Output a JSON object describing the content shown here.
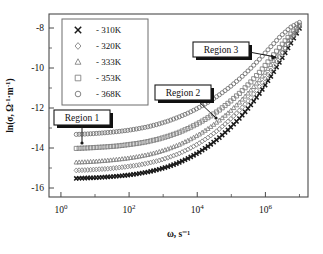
{
  "figure": {
    "kind": "scientific-plot",
    "background": "#ffffff"
  },
  "axes": {
    "x": {
      "label": "ω, s⁻¹",
      "scale": "log",
      "tick_labels": [
        "10⁰",
        "10²",
        "10⁴",
        "10⁶"
      ],
      "tick_exponents": [
        0,
        2,
        4,
        6
      ],
      "range_exponents": [
        -0.35,
        7.25
      ]
    },
    "y": {
      "label": "ln(σ, Ω⁻¹·m⁻¹)",
      "scale": "linear",
      "tick_labels": [
        "-8",
        "-10",
        "-12",
        "-14",
        "-16"
      ],
      "tick_values": [
        -8,
        -10,
        -12,
        -14,
        -16
      ],
      "range": [
        -16.45,
        -7.3
      ]
    }
  },
  "legend": {
    "entries": [
      {
        "marker": "cross-x",
        "dash": "-",
        "label": "310K",
        "color": "#1a1a1a"
      },
      {
        "marker": "diamond",
        "dash": "-",
        "label": "320K",
        "color": "#7d7d7d"
      },
      {
        "marker": "triangle",
        "dash": "-",
        "label": "333K",
        "color": "#7d7d7d"
      },
      {
        "marker": "square",
        "dash": "-",
        "label": "353K",
        "color": "#7d7d7d"
      },
      {
        "marker": "circle",
        "dash": "-",
        "label": "368K",
        "color": "#6f6f6f"
      }
    ]
  },
  "annotations": [
    {
      "id": "region-1",
      "text": "Region 1"
    },
    {
      "id": "region-2",
      "text": "Region 2"
    },
    {
      "id": "region-3",
      "text": "Region 3"
    }
  ],
  "chart_data": {
    "type": "scatter",
    "title": "",
    "xlabel": "ω, s⁻¹",
    "ylabel": "ln(σ, Ω⁻¹·m⁻¹)",
    "xscale": "log",
    "xlim_exponents": [
      -0.35,
      7.25
    ],
    "ylim": [
      -16.45,
      -7.3
    ],
    "grid": false,
    "legend_position": "top-left",
    "x_log10": [
      0.45,
      0.75,
      1.05,
      1.35,
      1.65,
      1.95,
      2.25,
      2.55,
      2.85,
      3.15,
      3.45,
      3.75,
      4.05,
      4.35,
      4.65,
      4.95,
      5.25,
      5.55,
      5.85,
      6.15,
      6.45,
      6.75,
      7.0
    ],
    "series": [
      {
        "name": "310K",
        "marker": "cross-x",
        "color": "#1a1a1a",
        "dc_plateau": -15.5,
        "values": [
          -15.52,
          -15.5,
          -15.48,
          -15.45,
          -15.41,
          -15.36,
          -15.29,
          -15.2,
          -15.08,
          -14.93,
          -14.74,
          -14.5,
          -14.22,
          -13.88,
          -13.48,
          -13.02,
          -12.5,
          -11.9,
          -11.22,
          -10.45,
          -9.62,
          -8.75,
          -8.02
        ]
      },
      {
        "name": "320K",
        "marker": "diamond",
        "color": "#7d7d7d",
        "dc_plateau": -15.1,
        "values": [
          -15.12,
          -15.1,
          -15.07,
          -15.04,
          -14.99,
          -14.93,
          -14.86,
          -14.76,
          -14.64,
          -14.48,
          -14.29,
          -14.05,
          -13.77,
          -13.44,
          -13.05,
          -12.6,
          -12.1,
          -11.53,
          -10.88,
          -10.15,
          -9.36,
          -8.58,
          -7.95
        ]
      },
      {
        "name": "333K",
        "marker": "triangle",
        "color": "#7d7d7d",
        "dc_plateau": -14.7,
        "values": [
          -14.72,
          -14.7,
          -14.67,
          -14.63,
          -14.58,
          -14.52,
          -14.44,
          -14.34,
          -14.21,
          -14.05,
          -13.85,
          -13.61,
          -13.33,
          -13.0,
          -12.62,
          -12.19,
          -11.7,
          -11.16,
          -10.55,
          -9.87,
          -9.14,
          -8.44,
          -7.9
        ]
      },
      {
        "name": "353K",
        "marker": "square",
        "color": "#7d7d7d",
        "dc_plateau": -14.0,
        "values": [
          -14.02,
          -14.0,
          -13.97,
          -13.94,
          -13.9,
          -13.84,
          -13.77,
          -13.68,
          -13.56,
          -13.41,
          -13.23,
          -13.01,
          -12.75,
          -12.45,
          -12.1,
          -11.7,
          -11.25,
          -10.74,
          -10.17,
          -9.54,
          -8.9,
          -8.3,
          -7.86
        ]
      },
      {
        "name": "368K",
        "marker": "circle",
        "color": "#6f6f6f",
        "dc_plateau": -13.3,
        "values": [
          -13.32,
          -13.3,
          -13.27,
          -13.23,
          -13.18,
          -13.12,
          -13.04,
          -12.94,
          -12.81,
          -12.65,
          -12.46,
          -12.24,
          -11.98,
          -11.68,
          -11.34,
          -10.96,
          -10.53,
          -10.05,
          -9.52,
          -8.95,
          -8.4,
          -7.95,
          -7.72
        ]
      }
    ],
    "annotations": [
      {
        "text": "Region 1",
        "points_to": "low-frequency DC plateau"
      },
      {
        "text": "Region 2",
        "points_to": "intermediate dispersion onset"
      },
      {
        "text": "Region 3",
        "points_to": "high-frequency power-law region"
      }
    ]
  }
}
